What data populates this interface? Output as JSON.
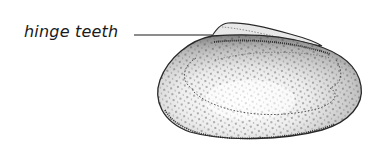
{
  "figure": {
    "labels": [
      {
        "text": "hinge teeth",
        "target": "hinge"
      }
    ]
  },
  "colors": {
    "text": "#1a1a1a",
    "outline": "#2a2a2a",
    "shell_light": "#f4f4f4",
    "shell_shadow": "#9a9a9a",
    "dots": "#3a3a3a"
  }
}
